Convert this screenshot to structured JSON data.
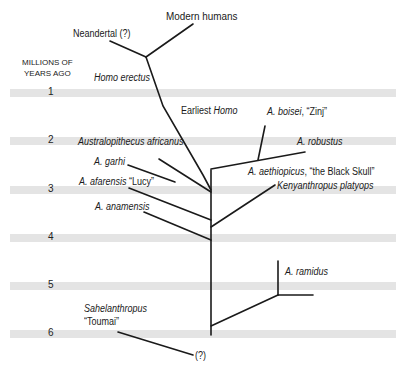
{
  "axis": {
    "title_line1": "MILLIONS OF",
    "title_line2": "YEARS AGO",
    "ticks": [
      "1",
      "2",
      "3",
      "4",
      "5",
      "6"
    ]
  },
  "species": {
    "modern_humans": "Modern humans",
    "neandertal": "Neandertal (?)",
    "homo_erectus": "Homo erectus",
    "earliest_homo_prefix": "Earliest ",
    "earliest_homo_genus": "Homo",
    "a_boisei_name": "A. boisei",
    "a_boisei_nick": ", “Zinj”",
    "a_robustus": "A. robustus",
    "au_africanus": "Australopithecus africanus",
    "a_garhi": "A. garhi",
    "a_afarensis_name": "A. afarensis",
    "a_afarensis_nick": " “Lucy”",
    "a_aethiopicus_name": "A. aethiopicus",
    "a_aethiopicus_nick": ", “the Black Skull”",
    "kenyanthropus": "Kenyanthropus platyops",
    "a_anamensis": "A. anamensis",
    "a_ramidus": "A. ramidus",
    "sahelanthropus": "Sahelanthropus",
    "toumai": "“Toumai”",
    "unknown_origin": "(?)"
  },
  "colors": {
    "band": "#e4e4e4",
    "line": "#1a1a1a"
  }
}
